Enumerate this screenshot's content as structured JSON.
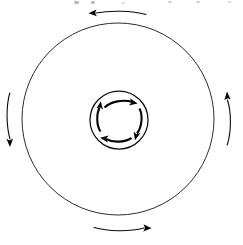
{
  "figure": {
    "canvas": {
      "width": 243,
      "height": 245,
      "background": "#ffffff"
    },
    "stroke_color": "#0a0a0a",
    "outer_circle": {
      "label": "outer circle",
      "center_x": 118,
      "center_y": 119,
      "radius": 96,
      "rotation_direction": "counterclockwise"
    },
    "inner_circle": {
      "label": "inner circle",
      "center_x": 119,
      "center_y": 120,
      "radius": 29,
      "rotation_direction": "clockwise"
    },
    "outer_arrows": [
      {
        "name": "top",
        "position": "top",
        "points": "left"
      },
      {
        "name": "right",
        "position": "right",
        "points": "up"
      },
      {
        "name": "bottom",
        "position": "bottom",
        "points": "right"
      },
      {
        "name": "left",
        "position": "left",
        "points": "down"
      }
    ],
    "inner_arrows": [
      {
        "name": "top",
        "position": "top",
        "points": "right"
      },
      {
        "name": "right",
        "position": "right",
        "points": "down"
      },
      {
        "name": "bottom",
        "position": "bottom",
        "points": "left"
      },
      {
        "name": "left",
        "position": "left",
        "points": "up"
      }
    ],
    "top_edge_artifacts": "faint cropped text remnants"
  }
}
